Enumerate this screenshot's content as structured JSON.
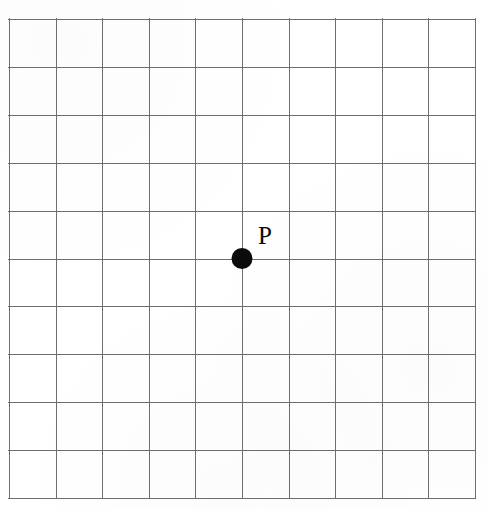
{
  "figure": {
    "name": "coordinate-grid-with-point",
    "background_color": "#ffffff",
    "line_color": "#6e6e6e",
    "ink_color": "#0b0b0b"
  },
  "grid": {
    "columns": 10,
    "rows": 10,
    "left_px": 9,
    "top_px": 19,
    "width_px": 466,
    "height_px": 479,
    "cell_width_px": 46.6,
    "cell_height_px": 47.9,
    "line_width_px": 1.5
  },
  "points": [
    {
      "label": "P",
      "grid_column": 5,
      "grid_row": 5,
      "x_px": 238,
      "y_px": 261,
      "radius_px": 10.5,
      "label_x_px": 254,
      "label_y_px": 246,
      "filled": true
    }
  ],
  "chart_data": {
    "type": "scatter",
    "title": "",
    "xlabel": "",
    "ylabel": "",
    "grid": true,
    "legend": "none",
    "xlim": [
      0,
      10
    ],
    "ylim": [
      0,
      10
    ],
    "xticks": [
      0,
      1,
      2,
      3,
      4,
      5,
      6,
      7,
      8,
      9,
      10
    ],
    "yticks": [
      0,
      1,
      2,
      3,
      4,
      5,
      6,
      7,
      8,
      9,
      10
    ],
    "xticklabels": [
      "",
      "",
      "",
      "",
      "",
      "",
      "",
      "",
      "",
      "",
      ""
    ],
    "yticklabels": [
      "",
      "",
      "",
      "",
      "",
      "",
      "",
      "",
      "",
      "",
      ""
    ],
    "series": [
      {
        "name": "P",
        "marker": "filled-circle",
        "color": "#0b0b0b",
        "x": [
          5
        ],
        "y": [
          5
        ],
        "labels": [
          "P"
        ]
      }
    ],
    "annotations": [
      {
        "text": "P",
        "x": 5,
        "y": 5,
        "offset_x": 0.35,
        "offset_y": 0.45
      }
    ]
  }
}
